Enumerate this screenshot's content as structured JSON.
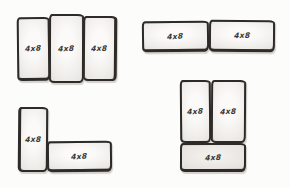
{
  "diagram": {
    "ink_color": "#2e2b28",
    "paper_color": "#fcfcfa",
    "sheet_fill_light": "#f1efec",
    "sheet_fill_shade": "#e7e4e0",
    "groups": [
      {
        "name": "three-vertical-sheets",
        "sheets": [
          {
            "label": "4x8"
          },
          {
            "label": "4x8"
          },
          {
            "label": "4x8"
          }
        ]
      },
      {
        "name": "two-horizontal-sheets",
        "sheets": [
          {
            "label": "4x8"
          },
          {
            "label": "4x8"
          }
        ]
      },
      {
        "name": "l-shape-sheets",
        "sheets": [
          {
            "label": "4x8"
          },
          {
            "label": "4x8"
          }
        ]
      },
      {
        "name": "two-vertical-plus-one-horizontal-sheets",
        "sheets": [
          {
            "label": "4x8"
          },
          {
            "label": "4x8"
          },
          {
            "label": "4x8"
          }
        ]
      }
    ]
  }
}
